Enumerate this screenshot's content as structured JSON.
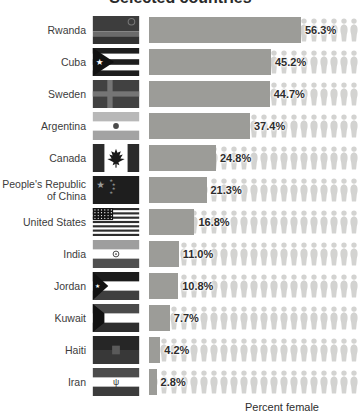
{
  "title": "Selected countries",
  "xlabel": "Percent female",
  "colors": {
    "bar": "#9c9c98",
    "person_icon": "#d3d3d1",
    "value_text": "#2d2d2d",
    "country_text": "#3c3c3c"
  },
  "chart_data": {
    "type": "bar",
    "orientation": "horizontal",
    "style": "pictogram (rows of person icons behind bars)",
    "title": "Selected countries",
    "xlabel": "Percent female",
    "xlim": [
      0,
      100
    ],
    "unit": "%",
    "categories": [
      "Rwanda",
      "Cuba",
      "Sweden",
      "Argentina",
      "Canada",
      "People's Republic of China",
      "United States",
      "India",
      "Jordan",
      "Kuwait",
      "Haiti",
      "Iran"
    ],
    "values": [
      56.3,
      45.2,
      44.7,
      37.4,
      24.8,
      21.3,
      16.8,
      11.0,
      10.8,
      7.7,
      4.2,
      2.8
    ],
    "data_labels": [
      "56.3%",
      "45.2%",
      "44.7%",
      "37.4%",
      "24.8%",
      "21.3%",
      "16.8%",
      "11.0%",
      "10.8%",
      "7.7%",
      "4.2%",
      "2.8%"
    ],
    "legend": "none",
    "grid": false
  },
  "rows": [
    {
      "label": "Rwanda",
      "flag": "rwanda",
      "value": 56.3,
      "value_label": "56.3%"
    },
    {
      "label": "Cuba",
      "flag": "cuba",
      "value": 45.2,
      "value_label": "45.2%"
    },
    {
      "label": "Sweden",
      "flag": "sweden",
      "value": 44.7,
      "value_label": "44.7%"
    },
    {
      "label": "Argentina",
      "flag": "argentina",
      "value": 37.4,
      "value_label": "37.4%"
    },
    {
      "label": "Canada",
      "flag": "canada",
      "value": 24.8,
      "value_label": "24.8%"
    },
    {
      "label": "People's Republic of China",
      "flag": "china",
      "value": 21.3,
      "value_label": "21.3%"
    },
    {
      "label": "United States",
      "flag": "usa",
      "value": 16.8,
      "value_label": "16.8%"
    },
    {
      "label": "India",
      "flag": "india",
      "value": 11.0,
      "value_label": "11.0%"
    },
    {
      "label": "Jordan",
      "flag": "jordan",
      "value": 10.8,
      "value_label": "10.8%"
    },
    {
      "label": "Kuwait",
      "flag": "kuwait",
      "value": 7.7,
      "value_label": "7.7%"
    },
    {
      "label": "Haiti",
      "flag": "haiti",
      "value": 4.2,
      "value_label": "4.2%"
    },
    {
      "label": "Iran",
      "flag": "iran",
      "value": 2.8,
      "value_label": "2.8%"
    }
  ]
}
